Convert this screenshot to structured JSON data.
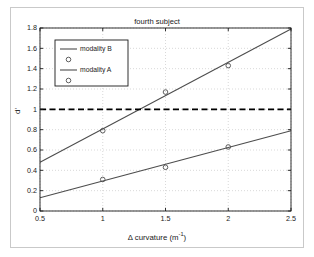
{
  "figure": {
    "title": "fourth subject",
    "x_axis_label_prefix": "Δ curvature (m",
    "x_axis_label_exponent": "-1",
    "x_axis_label_suffix": ")",
    "y_axis_label": "d'",
    "background_color": "#ffffff",
    "frame_color": "#c9c9c9",
    "axis_color": "#1a1a1a",
    "grid_color": "#c0c0c0"
  },
  "legend": {
    "entries": [
      {
        "label": "modality B",
        "marker": "line",
        "icon": "line-icon"
      },
      {
        "label": "",
        "marker": "circle",
        "icon": "circle-marker-icon"
      },
      {
        "label": "modality A",
        "marker": "line",
        "icon": "line-icon"
      },
      {
        "label": "",
        "marker": "circle",
        "icon": "circle-marker-icon"
      }
    ]
  },
  "chart_data": {
    "type": "line",
    "title": "fourth subject",
    "xlabel": "Δ curvature (m⁻¹)",
    "ylabel": "d'",
    "xlim": [
      0.5,
      2.5
    ],
    "ylim": [
      0,
      1.8
    ],
    "xticks": [
      "0.5",
      "1",
      "1.5",
      "2",
      "2.5"
    ],
    "xtick_values": [
      0.5,
      1,
      1.5,
      2,
      2.5
    ],
    "yticks": [
      "0",
      "0.2",
      "0.4",
      "0.6",
      "0.8",
      "1",
      "1.2",
      "1.4",
      "1.6",
      "1.8"
    ],
    "ytick_values": [
      0,
      0.2,
      0.4,
      0.6,
      0.8,
      1.0,
      1.2,
      1.4,
      1.6,
      1.8
    ],
    "grid": true,
    "grid_style": "dotted",
    "legend_position": "upper left",
    "series": [
      {
        "name": "modality B",
        "type": "fit-line",
        "color": "#4d4d4d",
        "line_style": "solid",
        "x": [
          0.5,
          2.5
        ],
        "values": [
          0.48,
          1.79
        ]
      },
      {
        "name": "modality B data",
        "type": "scatter",
        "color": "#4d4d4d",
        "marker": "circle",
        "x": [
          1.0,
          1.5,
          2.0
        ],
        "values": [
          0.79,
          1.17,
          1.43
        ]
      },
      {
        "name": "modality A",
        "type": "fit-line",
        "color": "#4d4d4d",
        "line_style": "solid",
        "x": [
          0.5,
          2.5
        ],
        "values": [
          0.13,
          0.79
        ]
      },
      {
        "name": "modality A data",
        "type": "scatter",
        "color": "#4d4d4d",
        "marker": "circle",
        "x": [
          1.0,
          1.5,
          2.0
        ],
        "values": [
          0.31,
          0.43,
          0.63
        ]
      }
    ],
    "annotations": [
      {
        "name": "threshold-line",
        "type": "hline",
        "y": 1.0,
        "line_style": "dashed",
        "color": "#000000"
      }
    ]
  }
}
